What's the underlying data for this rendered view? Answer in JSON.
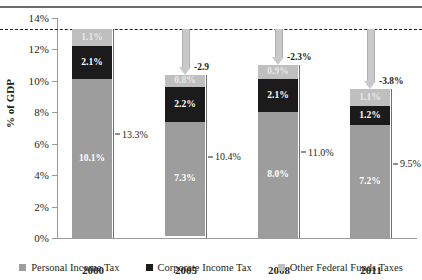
{
  "chart_data": {
    "type": "bar",
    "subtype": "stacked-bar",
    "title": "",
    "xlabel": "",
    "ylabel": "% of GDP",
    "ylim": [
      0,
      14
    ],
    "ytick_step": 2,
    "ytick_labels": [
      "0%",
      "2%",
      "4%",
      "6%",
      "8%",
      "10%",
      "12%",
      "14%"
    ],
    "ytick_values": [
      0,
      2,
      4,
      6,
      8,
      10,
      12,
      14
    ],
    "categories": [
      "2000",
      "2005",
      "2008",
      "2011"
    ],
    "grid": false,
    "legend_position": "bottom",
    "series": [
      {
        "name": "Personal Income Tax",
        "color": "#9d9d9d",
        "values": [
          10.1,
          7.3,
          8.0,
          7.2
        ],
        "labels": [
          "10.1%",
          "7.3%",
          "8.0%",
          "7.2%"
        ]
      },
      {
        "name": "Corporate Income Tax",
        "color": "#1b1b1b",
        "values": [
          2.1,
          2.2,
          2.1,
          1.2
        ],
        "labels": [
          "2.1%",
          "2.2%",
          "2.1%",
          "1.2%"
        ]
      },
      {
        "name": "Other Federal Funds Taxes",
        "color": "#bfbfbf",
        "values": [
          1.1,
          0.8,
          0.9,
          1.1
        ],
        "labels": [
          "1.1%",
          "0.8%",
          "0.9%",
          "1.1%"
        ]
      }
    ],
    "totals": [
      13.3,
      10.4,
      11.0,
      9.5
    ],
    "total_labels": [
      "13.3%",
      "10.4%",
      "11.0%",
      "9.5%"
    ],
    "reference_line": {
      "value": 13.3,
      "style": "dashed",
      "color": "#231f20"
    },
    "annotations": [
      {
        "category": "2005",
        "label": "-2.9",
        "from": 13.3,
        "to": 10.4
      },
      {
        "category": "2008",
        "label": "-2.3%",
        "from": 13.3,
        "to": 11.0
      },
      {
        "category": "2011",
        "label": "-3.8%",
        "from": 13.3,
        "to": 9.5
      }
    ]
  },
  "legend": {
    "items": [
      {
        "label": "Personal Income Tax",
        "color": "#9d9d9d"
      },
      {
        "label": "Corporate Income Tax",
        "color": "#1b1b1b"
      },
      {
        "label": "Other Federal Funds Taxes",
        "color": "#bfbfbf"
      }
    ]
  }
}
